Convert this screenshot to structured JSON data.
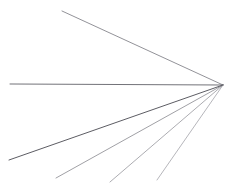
{
  "figure": {
    "title": "",
    "background_color": "#ffffff",
    "width": 234,
    "height": 189
  },
  "chart_data": {
    "type": "line",
    "title": "",
    "subtitle": "",
    "xlabel": "",
    "ylabel": "",
    "xlim": [
      0,
      234
    ],
    "ylim": [
      0,
      189
    ],
    "grid": false,
    "legend": null,
    "vertex": {
      "x": 223,
      "y": 85
    },
    "series": [
      {
        "name": "ray-1-upper-diagonal",
        "x": [
          223,
          62
        ],
        "y": [
          85,
          11
        ],
        "color": "#5a5a63",
        "width": 0.7,
        "opacity": 0.95
      },
      {
        "name": "ray-2-horizontal",
        "x": [
          223,
          10
        ],
        "y": [
          85,
          84
        ],
        "color": "#4e4e56",
        "width": 0.8,
        "opacity": 1
      },
      {
        "name": "ray-3-lower-steep",
        "x": [
          223,
          9
        ],
        "y": [
          85,
          160
        ],
        "color": "#3f3f47",
        "width": 0.85,
        "opacity": 1
      },
      {
        "name": "ray-4-lower-mid",
        "x": [
          223,
          56
        ],
        "y": [
          85,
          178
        ],
        "color": "#676770",
        "width": 0.7,
        "opacity": 0.9
      },
      {
        "name": "ray-5-lower-inner",
        "x": [
          223,
          110
        ],
        "y": [
          85,
          182
        ],
        "color": "#72727b",
        "width": 0.7,
        "opacity": 0.85
      },
      {
        "name": "ray-6-lower-steepest",
        "x": [
          223,
          157
        ],
        "y": [
          85,
          180
        ],
        "color": "#7c7c85",
        "width": 0.7,
        "opacity": 0.8
      }
    ]
  }
}
